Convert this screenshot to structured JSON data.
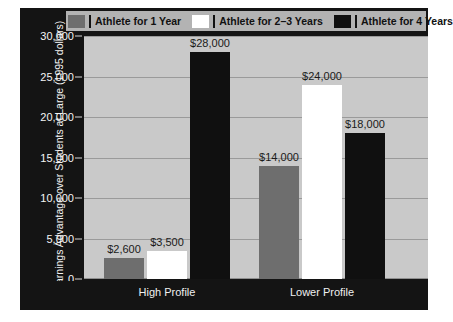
{
  "legend": {
    "entries": [
      {
        "label": "Athlete for 1 Year",
        "swatch": "gray",
        "color": "#6e6e6e"
      },
      {
        "label": "Athlete for 2–3 Years",
        "swatch": "white",
        "color": "#ffffff"
      },
      {
        "label": "Athlete for 4 Years",
        "swatch": "black",
        "color": "#101010"
      }
    ]
  },
  "axes": {
    "y_title": "Earnings Advantage over Students at Large (1995 dollars)",
    "y_ticks": [
      "0",
      "5,000",
      "10,000",
      "15,000",
      "20,000",
      "25,000",
      "30,000"
    ],
    "x_labels": [
      "High Profile",
      "Lower Profile"
    ]
  },
  "bars": [
    {
      "group": "High Profile",
      "series": "Athlete for 1 Year",
      "value": 2600,
      "label": "$2,600"
    },
    {
      "group": "High Profile",
      "series": "Athlete for 2–3 Years",
      "value": 3500,
      "label": "$3,500"
    },
    {
      "group": "High Profile",
      "series": "Athlete for 4 Years",
      "value": 28000,
      "label": "$28,000"
    },
    {
      "group": "Lower Profile",
      "series": "Athlete for 1 Year",
      "value": 14000,
      "label": "$14,000"
    },
    {
      "group": "Lower Profile",
      "series": "Athlete for 2–3 Years",
      "value": 24000,
      "label": "$24,000"
    },
    {
      "group": "Lower Profile",
      "series": "Athlete for 4 Years",
      "value": 18000,
      "label": "$18,000"
    }
  ],
  "colors": {
    "panel_background": "#141414",
    "plot_background": "#c9c9c9",
    "gridline": "#9a9a9a",
    "legend_background": "#b3b3b3",
    "tick_text": "#f5f5f5",
    "value_text": "#1a1a1a"
  },
  "chart_data": {
    "type": "bar",
    "title": "",
    "xlabel": "",
    "ylabel": "Earnings Advantage over Students at Large (1995 dollars)",
    "categories": [
      "High Profile",
      "Lower Profile"
    ],
    "series": [
      {
        "name": "Athlete for 1 Year",
        "values": [
          2600,
          3500
        ],
        "color": "#6e6e6e"
      },
      {
        "name": "Athlete for 2–3 Years",
        "values": [
          3500,
          24000
        ],
        "color": "#ffffff"
      },
      {
        "name": "Athlete for 4 Years",
        "values": [
          28000,
          18000
        ],
        "color": "#101010"
      }
    ],
    "series_corrected": [
      {
        "name": "Athlete for 1 Year",
        "values": [
          2600,
          14000
        ]
      },
      {
        "name": "Athlete for 2–3 Years",
        "values": [
          3500,
          24000
        ]
      },
      {
        "name": "Athlete for 4 Years",
        "values": [
          28000,
          18000
        ]
      }
    ],
    "data_labels": [
      "$2,600",
      "$3,500",
      "$28,000",
      "$14,000",
      "$24,000",
      "$18,000"
    ],
    "ylim": [
      0,
      30000
    ],
    "ytick_values": [
      0,
      5000,
      10000,
      15000,
      20000,
      25000,
      30000
    ],
    "ytick_labels": [
      "0",
      "5,000",
      "10,000",
      "15,000",
      "20,000",
      "25,000",
      "30,000"
    ],
    "grid": true,
    "grid_axis": "y",
    "legend_position": "top"
  }
}
